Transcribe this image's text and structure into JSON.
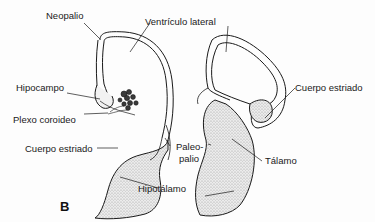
{
  "figure": {
    "panel_label": "B",
    "labels": {
      "neopalio": "Neopalio",
      "ventriculo_lateral": "Ventrículo lateral",
      "hipocampo": "Hipocampo",
      "plexo_coroideo": "Plexo coroideo",
      "cuerpo_estriado_left": "Cuerpo estriado",
      "paleopalio_1": "Paleo-",
      "paleopalio_2": "palio",
      "hipotalamo": "Hipotálamo",
      "cuerpo_estriado_right": "Cuerpo estriado",
      "talamo": "Tálamo"
    },
    "colors": {
      "line": "#1a1a1a",
      "stipple": "#c8c8c8",
      "background": "#fdfdfd"
    }
  }
}
